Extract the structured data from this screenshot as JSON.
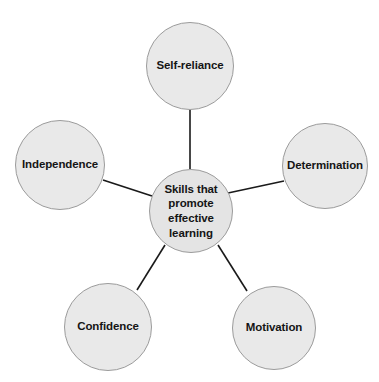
{
  "diagram": {
    "type": "hub-and-spoke-mind-map",
    "background_color": "#ffffff",
    "node_fill_color": "#e9e9e9",
    "node_border_color": "#9b9b9b",
    "edge_color": "#1a1a1a",
    "text_color": "#151515",
    "center": {
      "id": "center",
      "label": "Skills that promote effective learning",
      "lines": [
        "Skills that",
        "promote",
        "effective",
        "learning"
      ],
      "cx": 191,
      "cy": 211,
      "r": 42
    },
    "nodes": [
      {
        "id": "self-reliance",
        "label": "Self-reliance",
        "cx": 190,
        "cy": 66,
        "r": 44
      },
      {
        "id": "determination",
        "label": "Determination",
        "cx": 325,
        "cy": 166,
        "r": 43
      },
      {
        "id": "motivation",
        "label": "Motivation",
        "cx": 274,
        "cy": 328,
        "r": 42
      },
      {
        "id": "confidence",
        "label": "Confidence",
        "cx": 108,
        "cy": 327,
        "r": 44
      },
      {
        "id": "independence",
        "label": "Independence",
        "cx": 60,
        "cy": 165,
        "r": 45
      }
    ],
    "edges": [
      {
        "from": "center",
        "to": "self-reliance",
        "x1": 190,
        "y1": 169,
        "x2": 190,
        "y2": 110
      },
      {
        "from": "center",
        "to": "determination",
        "x1": 228,
        "y1": 193,
        "x2": 284,
        "y2": 181
      },
      {
        "from": "center",
        "to": "motivation",
        "x1": 218,
        "y1": 245,
        "x2": 247,
        "y2": 291
      },
      {
        "from": "center",
        "to": "confidence",
        "x1": 165,
        "y1": 245,
        "x2": 137,
        "y2": 290
      },
      {
        "from": "center",
        "to": "independence",
        "x1": 152,
        "y1": 196,
        "x2": 103,
        "y2": 180
      }
    ]
  }
}
